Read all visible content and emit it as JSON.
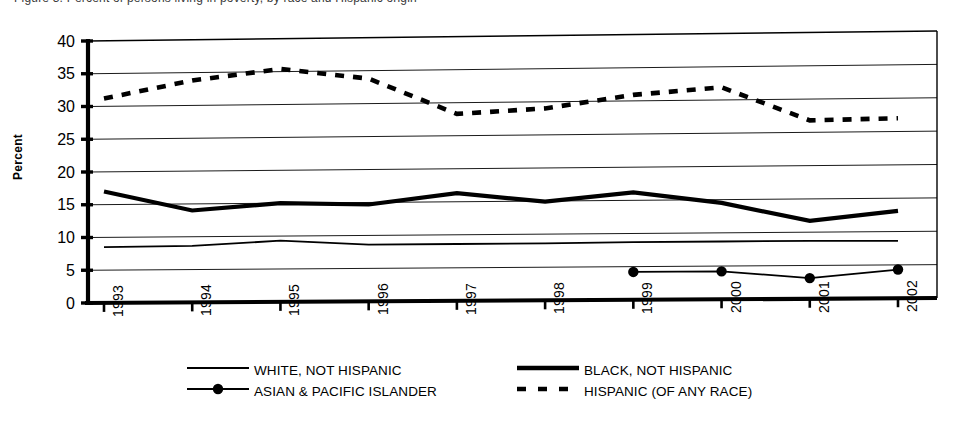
{
  "figure": {
    "top_caption_fragment": "Figure 3. Percent of persons living in poverty, by race and Hispanic origin",
    "ylabel": "Percent",
    "xlabel": ""
  },
  "legend": {
    "items": [
      {
        "label": "WHITE, NOT HISPANIC",
        "style": "thin-solid",
        "color": "#000000"
      },
      {
        "label": "ASIAN & PACIFIC ISLANDER",
        "style": "solid-marker",
        "color": "#000000"
      },
      {
        "label": "BLACK, NOT HISPANIC",
        "style": "thick-solid",
        "color": "#000000"
      },
      {
        "label": "HISPANIC (OF ANY RACE)",
        "style": "dashed",
        "color": "#000000"
      }
    ]
  },
  "chart_data": {
    "type": "line",
    "title": "",
    "xlabel": "",
    "ylabel": "Percent",
    "ylim": [
      0,
      40
    ],
    "ytick_step": 5,
    "yticks": [
      0,
      5,
      10,
      15,
      20,
      25,
      30,
      35,
      40
    ],
    "grid": true,
    "legend_position": "bottom",
    "categories": [
      "1993",
      "1994",
      "1995",
      "1996",
      "1997",
      "1998",
      "1999",
      "2000",
      "2001",
      "2002"
    ],
    "series": [
      {
        "name": "WHITE, NOT HISPANIC",
        "style": "thin-solid",
        "values": [
          8.5,
          8.6,
          9.3,
          8.6,
          8.6,
          8.6,
          8.7,
          8.7,
          8.7,
          8.6
        ]
      },
      {
        "name": "BLACK, NOT HISPANIC",
        "style": "thick-solid",
        "values": [
          17.0,
          14.0,
          15.0,
          14.7,
          16.3,
          14.9,
          16.2,
          14.5,
          11.7,
          13.1
        ]
      },
      {
        "name": "ASIAN & PACIFIC ISLANDER",
        "style": "solid-marker",
        "values": [
          null,
          null,
          null,
          null,
          null,
          null,
          4.2,
          4.2,
          3.1,
          4.3
        ]
      },
      {
        "name": "HISPANIC (OF ANY RACE)",
        "style": "dashed",
        "values": [
          31.2,
          33.8,
          35.4,
          33.8,
          28.3,
          29.0,
          30.9,
          31.9,
          26.8,
          27.0
        ]
      }
    ]
  }
}
